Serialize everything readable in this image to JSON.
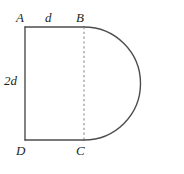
{
  "figure": {
    "kind": "geometry-diagram",
    "stroke_color": "#4d4d4d",
    "label_color": "#231f20",
    "background_color": "#ffffff",
    "labels": {
      "vertex_top_left": "A",
      "vertex_top_right": "B",
      "vertex_bottom_right": "C",
      "vertex_bottom_left": "D",
      "top_side_length": "d",
      "left_side_length": "2d"
    },
    "geometry": {
      "rect_left_x": 25,
      "rect_right_x": 84,
      "rect_top_y": 27,
      "rect_bottom_y": 140,
      "semicircle_apex_x": 141,
      "semicircle_center_y": 83.5,
      "semicircle_radius": 56.5,
      "dashed_segment": "BC"
    }
  }
}
